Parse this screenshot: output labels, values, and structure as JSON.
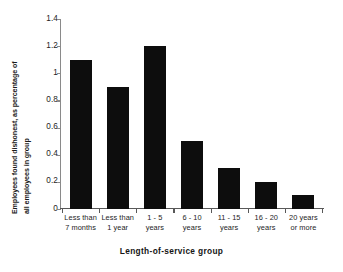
{
  "chart_data": {
    "type": "bar",
    "title": "",
    "xlabel": "Length-of-service group",
    "ylabel": "Employees found dishonest, as percentage of all employees in group",
    "ylabel_lines": [
      "Employees found dishonest, as percentage of",
      "all employees in group"
    ],
    "categories": [
      "Less than 7 months",
      "Less than 1 year",
      "1 - 5 years",
      "6 - 10 years",
      "11 - 15 years",
      "16 - 20 years",
      "20 years or more"
    ],
    "category_lines": [
      [
        "Less than",
        "7 months"
      ],
      [
        "Less than",
        "1 year"
      ],
      [
        "1 - 5",
        "years"
      ],
      [
        "6 - 10",
        "years"
      ],
      [
        "11 - 15",
        "years"
      ],
      [
        "16 - 20",
        "years"
      ],
      [
        "20 years",
        "or more"
      ]
    ],
    "values": [
      1.1,
      0.9,
      1.2,
      0.5,
      0.3,
      0.2,
      0.1
    ],
    "ylim": [
      0,
      1.4
    ],
    "ytick_values": [
      0,
      0.2,
      0.4,
      0.6,
      0.8,
      1.0,
      1.2,
      1.4
    ],
    "ytick_labels": [
      "0",
      "0.2",
      "0.4",
      "0.6",
      "0.8",
      "1",
      "1.2",
      "1.4"
    ],
    "grid": false,
    "legend": "none",
    "bar_color": "#0d0d0d",
    "axis_color": "#8a8a8a"
  }
}
